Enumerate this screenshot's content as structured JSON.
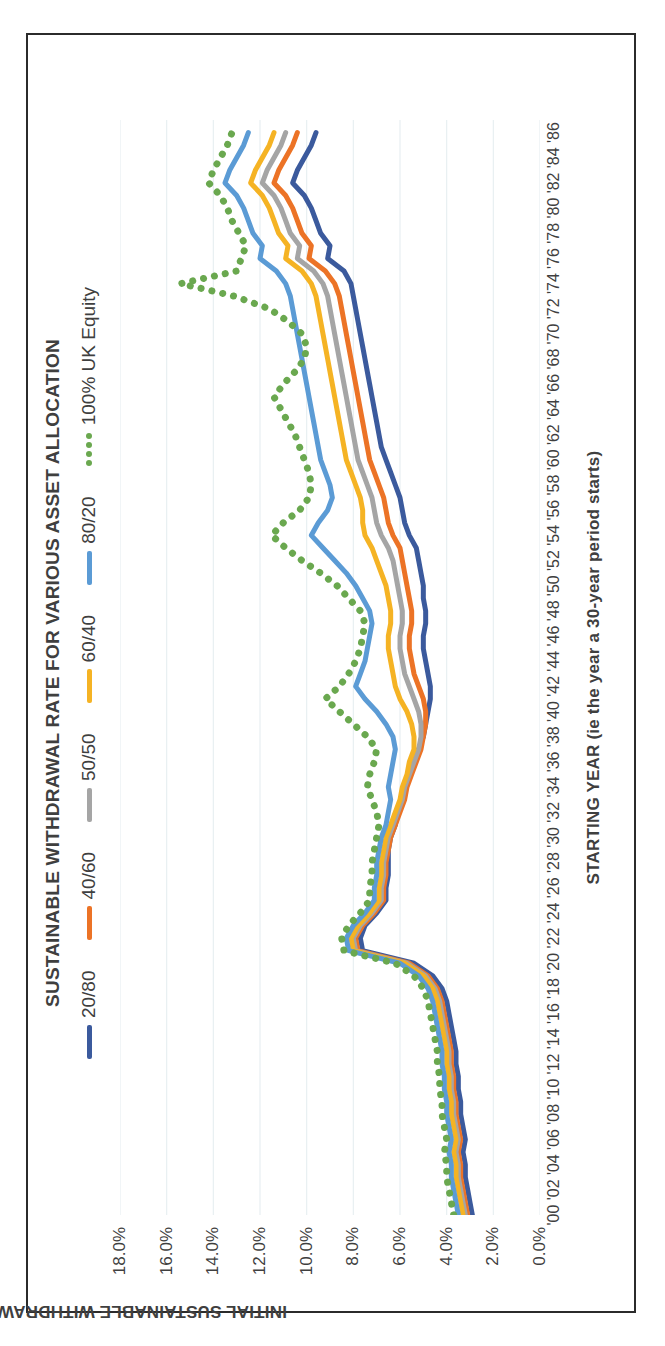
{
  "chart_data": {
    "type": "line",
    "title": "SUSTAINABLE WITHDRAWAL RATE FOR VARIOUS ASSET ALLOCATION",
    "xlabel": "STARTING YEAR (ie the year a 30-year period starts)",
    "ylabel": "INITIAL SUSTAINABLE WITHDRAWAL RATE",
    "ylim": [
      0,
      18
    ],
    "ytick_labels": [
      "0.0%",
      "2.0%",
      "4.0%",
      "6.0%",
      "8.0%",
      "10.0%",
      "12.0%",
      "14.0%",
      "16.0%",
      "18.0%"
    ],
    "ytick_values": [
      0,
      2,
      4,
      6,
      8,
      10,
      12,
      14,
      16,
      18
    ],
    "grid": "vertical",
    "legend_position": "top",
    "xlim": [
      1900,
      1987
    ],
    "xtick_labels": [
      "'00",
      "'02",
      "'04",
      "'06",
      "'08",
      "'10",
      "'12",
      "'14",
      "'16",
      "'18",
      "'20",
      "'22",
      "'24",
      "'26",
      "'28",
      "'30",
      "'32",
      "'34",
      "'36",
      "'38",
      "'40",
      "'42",
      "'44",
      "'46",
      "'48",
      "'50",
      "'52",
      "'54",
      "'56",
      "'58",
      "'60",
      "'62",
      "'64",
      "'66",
      "'68",
      "'70",
      "'72",
      "'74",
      "'76",
      "'78",
      "'80",
      "'82",
      "'84",
      "'86"
    ],
    "xtick_values": [
      1900,
      1902,
      1904,
      1906,
      1908,
      1910,
      1912,
      1914,
      1916,
      1918,
      1920,
      1922,
      1924,
      1926,
      1928,
      1930,
      1932,
      1934,
      1936,
      1938,
      1940,
      1942,
      1944,
      1946,
      1948,
      1950,
      1952,
      1954,
      1956,
      1958,
      1960,
      1962,
      1964,
      1966,
      1968,
      1970,
      1972,
      1974,
      1976,
      1978,
      1980,
      1982,
      1984,
      1986
    ],
    "x": [
      1900,
      1901,
      1902,
      1903,
      1904,
      1905,
      1906,
      1907,
      1908,
      1909,
      1910,
      1911,
      1912,
      1913,
      1914,
      1915,
      1916,
      1917,
      1918,
      1919,
      1920,
      1921,
      1922,
      1923,
      1924,
      1925,
      1926,
      1927,
      1928,
      1929,
      1930,
      1931,
      1932,
      1933,
      1934,
      1935,
      1936,
      1937,
      1938,
      1939,
      1940,
      1941,
      1942,
      1943,
      1944,
      1945,
      1946,
      1947,
      1948,
      1949,
      1950,
      1951,
      1952,
      1953,
      1954,
      1955,
      1956,
      1957,
      1958,
      1959,
      1960,
      1961,
      1962,
      1963,
      1964,
      1965,
      1966,
      1967,
      1968,
      1969,
      1970,
      1971,
      1972,
      1973,
      1974,
      1975,
      1976,
      1977,
      1978,
      1979,
      1980,
      1981,
      1982,
      1983,
      1984,
      1985,
      1986
    ],
    "series": [
      {
        "name": "20/80",
        "color": "#3b5a9d",
        "style": "solid",
        "values": [
          2.9,
          3.0,
          3.1,
          3.2,
          3.2,
          3.3,
          3.2,
          3.3,
          3.4,
          3.4,
          3.5,
          3.5,
          3.6,
          3.6,
          3.7,
          3.8,
          3.9,
          4.0,
          4.2,
          4.6,
          5.4,
          7.6,
          7.7,
          7.5,
          7.0,
          6.6,
          6.6,
          6.5,
          6.5,
          6.5,
          6.4,
          6.2,
          6.1,
          5.9,
          5.8,
          5.6,
          5.4,
          5.2,
          5.0,
          4.9,
          4.8,
          4.7,
          4.7,
          4.8,
          4.9,
          5.0,
          5.0,
          4.9,
          4.9,
          5.0,
          5.0,
          5.1,
          5.2,
          5.3,
          5.6,
          5.8,
          5.9,
          6.0,
          6.2,
          6.4,
          6.6,
          6.8,
          6.9,
          7.0,
          7.1,
          7.2,
          7.3,
          7.4,
          7.5,
          7.6,
          7.7,
          7.8,
          7.9,
          8.0,
          8.1,
          8.4,
          9.1,
          9.0,
          9.4,
          9.6,
          9.8,
          10.1,
          10.6,
          10.4,
          10.1,
          9.8,
          9.6
        ]
      },
      {
        "name": "40/60",
        "color": "#ec7326",
        "style": "solid",
        "values": [
          3.1,
          3.2,
          3.3,
          3.4,
          3.4,
          3.5,
          3.4,
          3.5,
          3.6,
          3.6,
          3.7,
          3.7,
          3.8,
          3.8,
          3.9,
          4.0,
          4.1,
          4.2,
          4.4,
          4.8,
          5.6,
          7.8,
          7.9,
          7.6,
          7.1,
          6.7,
          6.7,
          6.6,
          6.6,
          6.5,
          6.4,
          6.2,
          6.0,
          5.8,
          5.7,
          5.5,
          5.3,
          5.1,
          5.0,
          4.9,
          4.9,
          5.0,
          5.2,
          5.4,
          5.5,
          5.6,
          5.6,
          5.5,
          5.5,
          5.6,
          5.7,
          5.8,
          5.9,
          6.0,
          6.3,
          6.5,
          6.6,
          6.7,
          6.9,
          7.1,
          7.3,
          7.4,
          7.5,
          7.6,
          7.7,
          7.8,
          7.9,
          8.0,
          8.1,
          8.2,
          8.3,
          8.4,
          8.5,
          8.6,
          8.8,
          9.2,
          9.9,
          9.8,
          10.2,
          10.4,
          10.6,
          10.9,
          11.4,
          11.2,
          10.9,
          10.6,
          10.4
        ]
      },
      {
        "name": "50/50",
        "color": "#a5a5a5",
        "style": "solid",
        "values": [
          3.2,
          3.3,
          3.4,
          3.5,
          3.5,
          3.6,
          3.5,
          3.6,
          3.7,
          3.7,
          3.8,
          3.8,
          3.9,
          3.9,
          4.0,
          4.1,
          4.2,
          4.3,
          4.5,
          4.9,
          5.7,
          7.9,
          8.0,
          7.7,
          7.2,
          6.8,
          6.8,
          6.7,
          6.7,
          6.6,
          6.5,
          6.3,
          6.1,
          5.9,
          5.8,
          5.6,
          5.4,
          5.2,
          5.1,
          5.1,
          5.2,
          5.4,
          5.6,
          5.8,
          5.9,
          6.0,
          6.0,
          5.9,
          5.9,
          6.0,
          6.1,
          6.2,
          6.3,
          6.5,
          6.8,
          7.0,
          7.1,
          7.2,
          7.4,
          7.6,
          7.8,
          7.9,
          8.0,
          8.1,
          8.2,
          8.3,
          8.4,
          8.5,
          8.6,
          8.7,
          8.8,
          8.9,
          9.0,
          9.1,
          9.3,
          9.7,
          10.4,
          10.3,
          10.7,
          10.9,
          11.1,
          11.4,
          11.9,
          11.7,
          11.4,
          11.1,
          10.9
        ]
      },
      {
        "name": "60/40",
        "color": "#f5b324",
        "style": "solid",
        "values": [
          3.3,
          3.4,
          3.5,
          3.6,
          3.6,
          3.7,
          3.6,
          3.7,
          3.8,
          3.8,
          3.9,
          3.9,
          4.0,
          4.0,
          4.1,
          4.2,
          4.3,
          4.4,
          4.6,
          5.0,
          5.8,
          8.0,
          8.1,
          7.8,
          7.3,
          6.9,
          6.9,
          6.8,
          6.8,
          6.7,
          6.6,
          6.4,
          6.2,
          6.0,
          5.9,
          5.7,
          5.6,
          5.4,
          5.4,
          5.5,
          5.7,
          6.0,
          6.2,
          6.3,
          6.4,
          6.5,
          6.5,
          6.4,
          6.4,
          6.5,
          6.6,
          6.8,
          7.0,
          7.2,
          7.5,
          7.6,
          7.6,
          7.7,
          7.9,
          8.1,
          8.3,
          8.4,
          8.5,
          8.6,
          8.7,
          8.8,
          8.9,
          9.0,
          9.1,
          9.2,
          9.3,
          9.4,
          9.5,
          9.6,
          9.8,
          10.2,
          10.9,
          10.8,
          11.2,
          11.4,
          11.6,
          11.9,
          12.4,
          12.2,
          11.9,
          11.6,
          11.4
        ]
      },
      {
        "name": "80/20",
        "color": "#5b9bd5",
        "style": "solid",
        "values": [
          3.5,
          3.6,
          3.7,
          3.8,
          3.8,
          3.9,
          3.8,
          3.9,
          4.0,
          4.0,
          4.1,
          4.1,
          4.2,
          4.2,
          4.3,
          4.4,
          4.5,
          4.6,
          4.8,
          5.2,
          6.0,
          8.2,
          8.3,
          8.0,
          7.5,
          7.1,
          7.1,
          7.0,
          7.0,
          6.9,
          6.8,
          6.6,
          6.5,
          6.4,
          6.5,
          6.4,
          6.3,
          6.2,
          6.3,
          6.6,
          7.0,
          7.5,
          7.9,
          7.7,
          7.5,
          7.4,
          7.3,
          7.2,
          7.3,
          7.6,
          7.9,
          8.3,
          8.8,
          9.3,
          9.8,
          9.5,
          9.1,
          8.9,
          9.0,
          9.2,
          9.4,
          9.5,
          9.6,
          9.7,
          9.8,
          9.9,
          10.0,
          10.1,
          10.2,
          10.3,
          10.4,
          10.5,
          10.6,
          10.7,
          10.9,
          11.3,
          12.0,
          11.9,
          12.3,
          12.5,
          12.7,
          13.0,
          13.5,
          13.3,
          13.0,
          12.7,
          12.5
        ]
      },
      {
        "name": "100% UK Equity",
        "color": "#6aa84f",
        "style": "dotted",
        "values": [
          3.7,
          3.8,
          3.9,
          4.0,
          4.0,
          4.1,
          4.0,
          4.1,
          4.2,
          4.2,
          4.3,
          4.3,
          4.4,
          4.4,
          4.5,
          4.6,
          4.7,
          4.8,
          5.0,
          5.4,
          6.2,
          8.4,
          8.5,
          8.2,
          7.7,
          7.3,
          7.3,
          7.2,
          7.2,
          7.1,
          7.0,
          6.9,
          7.0,
          7.2,
          7.4,
          7.3,
          7.1,
          7.0,
          7.4,
          8.0,
          8.6,
          9.2,
          8.6,
          8.2,
          7.9,
          7.7,
          7.6,
          7.5,
          7.7,
          8.2,
          8.7,
          9.4,
          10.2,
          10.9,
          11.5,
          11.0,
          10.3,
          9.9,
          9.8,
          9.9,
          10.1,
          10.3,
          10.5,
          10.8,
          11.1,
          11.4,
          11.0,
          10.5,
          10.1,
          10.0,
          10.2,
          10.8,
          11.6,
          13.1,
          15.4,
          13.0,
          12.8,
          12.6,
          12.9,
          13.2,
          13.4,
          13.7,
          14.2,
          14.0,
          13.7,
          13.4,
          13.2
        ]
      }
    ]
  }
}
